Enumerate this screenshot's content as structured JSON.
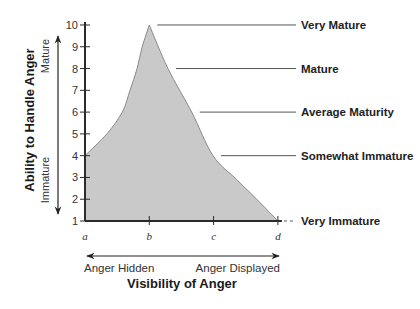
{
  "chart_data": {
    "type": "area",
    "title": "",
    "xlabel": "Visibility of Anger",
    "ylabel": "Ability to Handle Anger",
    "x_ticks": [
      "a",
      "b",
      "c",
      "d"
    ],
    "y_ticks": [
      1,
      2,
      3,
      4,
      5,
      6,
      7,
      8,
      9,
      10
    ],
    "xlim": [
      0,
      3
    ],
    "ylim": [
      1,
      10
    ],
    "grid": false,
    "series": [
      {
        "name": "Ability to handle anger vs visibility",
        "points": [
          {
            "x": 0,
            "y": 4
          },
          {
            "x": 0.34,
            "y": 5
          },
          {
            "x": 0.58,
            "y": 6
          },
          {
            "x": 0.7,
            "y": 7
          },
          {
            "x": 0.81,
            "y": 8
          },
          {
            "x": 0.89,
            "y": 9
          },
          {
            "x": 1,
            "y": 10
          },
          {
            "x": 1.29,
            "y": 8
          },
          {
            "x": 1.66,
            "y": 6
          },
          {
            "x": 1.99,
            "y": 4
          },
          {
            "x": 2.36,
            "y": 2.9
          },
          {
            "x": 2.67,
            "y": 2
          },
          {
            "x": 3,
            "y": 1
          }
        ]
      }
    ],
    "annotations": [
      {
        "label": "Very Mature",
        "y": 10
      },
      {
        "label": "Mature",
        "y": 8
      },
      {
        "label": "Average Maturity",
        "y": 6
      },
      {
        "label": "Somewhat Immature",
        "y": 4
      },
      {
        "label": "Very Immature",
        "y": 1
      }
    ],
    "y_direction_labels": {
      "top": "Mature",
      "bottom": "Immature"
    },
    "x_direction_labels": {
      "left": "Anger Hidden",
      "right": "Anger Displayed"
    }
  },
  "colors": {
    "fill": "#c9c9c9",
    "curve": "#8a8a8a",
    "axis": "#2b2b2b",
    "leader": "#555555"
  }
}
